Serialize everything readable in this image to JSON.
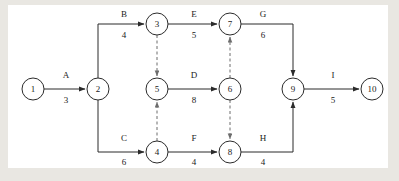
{
  "diagram": {
    "type": "network-diagram",
    "colors": {
      "background": "#e9e7e2",
      "canvas": "#ffffff",
      "stroke": "#2b2b2b",
      "dummy": "#6d6d6d"
    },
    "nodes": [
      {
        "id": "n1",
        "label": "1",
        "x": 33,
        "y": 89,
        "r": 11
      },
      {
        "id": "n2",
        "label": "2",
        "x": 98,
        "y": 89,
        "r": 11
      },
      {
        "id": "n3",
        "label": "3",
        "x": 157,
        "y": 24,
        "r": 11
      },
      {
        "id": "n4",
        "label": "4",
        "x": 157,
        "y": 152,
        "r": 11
      },
      {
        "id": "n5",
        "label": "5",
        "x": 157,
        "y": 89,
        "r": 11
      },
      {
        "id": "n6",
        "label": "6",
        "x": 230,
        "y": 89,
        "r": 11
      },
      {
        "id": "n7",
        "label": "7",
        "x": 230,
        "y": 24,
        "r": 11
      },
      {
        "id": "n8",
        "label": "8",
        "x": 230,
        "y": 152,
        "r": 11
      },
      {
        "id": "n9",
        "label": "9",
        "x": 293,
        "y": 89,
        "r": 11
      },
      {
        "id": "n10",
        "label": "10",
        "x": 372,
        "y": 89,
        "r": 11
      }
    ],
    "activities": [
      {
        "id": "A",
        "name": "A",
        "duration": "3",
        "from": "1",
        "to": "2",
        "name_x": 66,
        "name_y": 78,
        "dur_x": 66,
        "dur_y": 103
      },
      {
        "id": "B",
        "name": "B",
        "duration": "4",
        "from": "2",
        "to": "3",
        "name_x": 124,
        "name_y": 17,
        "dur_x": 124,
        "dur_y": 38
      },
      {
        "id": "C",
        "name": "C",
        "duration": "6",
        "from": "2",
        "to": "4",
        "name_x": 124,
        "name_y": 141,
        "dur_x": 124,
        "dur_y": 165
      },
      {
        "id": "D",
        "name": "D",
        "duration": "8",
        "from": "5",
        "to": "6",
        "name_x": 194,
        "name_y": 78,
        "dur_x": 194,
        "dur_y": 103
      },
      {
        "id": "E",
        "name": "E",
        "duration": "5",
        "from": "3",
        "to": "7",
        "name_x": 194,
        "name_y": 17,
        "dur_x": 194,
        "dur_y": 38
      },
      {
        "id": "F",
        "name": "F",
        "duration": "4",
        "from": "4",
        "to": "8",
        "name_x": 194,
        "name_y": 141,
        "dur_x": 194,
        "dur_y": 165
      },
      {
        "id": "G",
        "name": "G",
        "duration": "6",
        "from": "7",
        "to": "9",
        "name_x": 263,
        "name_y": 17,
        "dur_x": 263,
        "dur_y": 38
      },
      {
        "id": "H",
        "name": "H",
        "duration": "4",
        "from": "8",
        "to": "9",
        "name_x": 263,
        "name_y": 141,
        "dur_x": 263,
        "dur_y": 165
      },
      {
        "id": "I",
        "name": "I",
        "duration": "5",
        "from": "9",
        "to": "10",
        "name_x": 333,
        "name_y": 78,
        "dur_x": 333,
        "dur_y": 103
      }
    ],
    "dummies": [
      {
        "id": "d1",
        "from": "3",
        "to": "5",
        "direction": "down"
      },
      {
        "id": "d2",
        "from": "4",
        "to": "5",
        "direction": "up"
      },
      {
        "id": "d3",
        "from": "6",
        "to": "7",
        "direction": "up"
      },
      {
        "id": "d4",
        "from": "6",
        "to": "8",
        "direction": "down"
      }
    ]
  }
}
